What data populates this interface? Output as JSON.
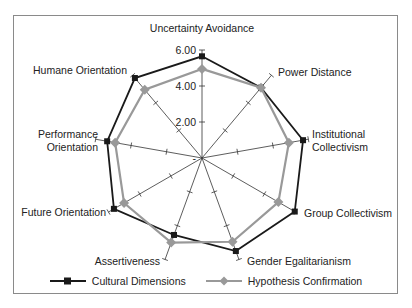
{
  "chart_data": {
    "type": "radar",
    "title": "",
    "axes": [
      "Uncertainty Avoidance",
      "Power Distance",
      "Institutional Collectivism",
      "Group Collectivism",
      "Gender Egalitarianism",
      "Assertiveness",
      "Future Orientation",
      "Performance Orientation",
      "Humane Orientation"
    ],
    "axis_label_lines": [
      [
        "Uncertainty Avoidance"
      ],
      [
        "Power Distance"
      ],
      [
        "Institutional",
        "Collectivism"
      ],
      [
        "Group Collectivism"
      ],
      [
        "Gender Egalitarianism"
      ],
      [
        "Assertiveness"
      ],
      [
        "Future Orientation"
      ],
      [
        "Performance",
        "Orientation"
      ],
      [
        "Humane Orientation"
      ]
    ],
    "radial_ticks": [
      0,
      2,
      4,
      6
    ],
    "radial_tick_labels": [
      "-",
      "2.00",
      "4.00",
      "6.00"
    ],
    "rlim": [
      0,
      6
    ],
    "series": [
      {
        "name": "Cultural Dimensions",
        "color": "#1a1a1a",
        "marker": "square",
        "values": [
          5.65,
          5.1,
          5.7,
          5.95,
          5.5,
          4.55,
          5.65,
          5.35,
          5.8
        ]
      },
      {
        "name": "Hypothesis Confirmation",
        "color": "#999999",
        "marker": "diamond",
        "values": [
          4.95,
          5.1,
          4.9,
          4.9,
          4.95,
          5.0,
          5.0,
          4.9,
          4.95
        ]
      }
    ],
    "legend_position": "bottom"
  },
  "legend": {
    "items": [
      "Cultural Dimensions",
      "Hypothesis Confirmation"
    ]
  }
}
